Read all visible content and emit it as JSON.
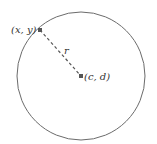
{
  "diagram": {
    "circle": {
      "cx": 81,
      "cy": 76,
      "r": 64,
      "stroke": "#6b6b6b"
    },
    "point_on_circle": {
      "label": "(x, y)",
      "x": 40,
      "y": 30
    },
    "center": {
      "label": "(c, d)",
      "x": 81,
      "y": 76
    },
    "radius": {
      "label": "r",
      "style": "dashed"
    },
    "colors": {
      "line": "#6b6b6b",
      "point": "#555555",
      "text": "#333333"
    }
  }
}
